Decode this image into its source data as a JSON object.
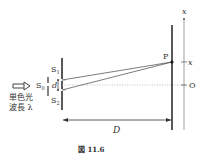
{
  "diagram": {
    "type": "double-slit-interference",
    "labels": {
      "source_line1": "単色光",
      "source_line2": "波長 λ",
      "s0": "S",
      "s0_sub": "0",
      "s1": "S",
      "s1_sub": "1",
      "s2": "S",
      "s2_sub": "2",
      "d": "d",
      "p": "P",
      "x_axis": "x",
      "x_mark": "x",
      "origin": "O",
      "distance": "D"
    },
    "caption": "図 11.6",
    "colors": {
      "line": "#333333",
      "screen": "#222222",
      "axis": "#777777",
      "dotted": "#999999"
    }
  }
}
